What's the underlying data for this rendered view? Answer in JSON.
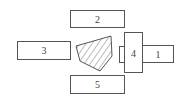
{
  "diagram": {
    "type": "schematic-layout",
    "components": [
      {
        "id": "1",
        "label": "1"
      },
      {
        "id": "2",
        "label": "2"
      },
      {
        "id": "3",
        "label": "3"
      },
      {
        "id": "4",
        "label": "4"
      },
      {
        "id": "5",
        "label": "5"
      }
    ],
    "workpiece": {
      "style": "hatched-pentagon"
    },
    "colors": {
      "stroke": "#555555",
      "text": "#444444",
      "background": "#ffffff"
    }
  }
}
